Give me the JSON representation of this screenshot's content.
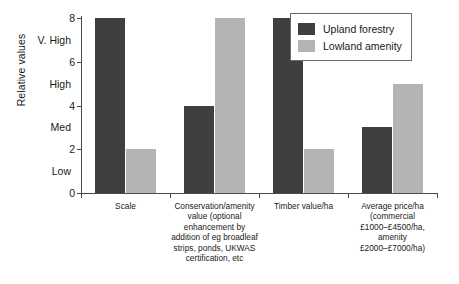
{
  "chart_data": {
    "type": "bar",
    "title": "",
    "xlabel": "",
    "ylabel": "Relative values",
    "ylim": [
      0,
      8
    ],
    "grid": false,
    "legend_position": "top-right",
    "categories": [
      "Scale",
      "Conservation/amenity value (optional enhancement by addition of eg broadleaf strips, ponds, UKWAS certification, etc",
      "Timber value/ha",
      "Average price/ha (commercial £1000–£4500/ha, amenity £2000–£7000/ha)"
    ],
    "category_lines": [
      [
        "Scale"
      ],
      [
        "Conservation/amenity",
        "value (optional",
        "enhancement by",
        "addition of eg broadleaf",
        "strips, ponds, UKWAS",
        "certification, etc"
      ],
      [
        "Timber value/ha"
      ],
      [
        "Average price/ha",
        "(commercial",
        "£1000–£4500/ha,",
        "amenity",
        "£2000–£7000/ha)"
      ]
    ],
    "series": [
      {
        "name": "Upland forestry",
        "color": "#3f3f3f",
        "values": [
          8,
          4,
          8,
          3
        ]
      },
      {
        "name": "Lowland amenity",
        "color": "#b4b4b4",
        "values": [
          2,
          8,
          2,
          5
        ]
      }
    ],
    "y_numeric_ticks": [
      {
        "value": 0,
        "label": "0"
      },
      {
        "value": 2,
        "label": "2"
      },
      {
        "value": 4,
        "label": "4"
      },
      {
        "value": 6,
        "label": "6"
      },
      {
        "value": 8,
        "label": "8"
      }
    ],
    "y_word_ticks": [
      {
        "value": 1,
        "label": "Low"
      },
      {
        "value": 3,
        "label": "Med"
      },
      {
        "value": 5,
        "label": "High"
      },
      {
        "value": 7,
        "label": "V. High"
      }
    ]
  },
  "legend": {
    "items": [
      {
        "label": "Upland forestry",
        "color": "#3f3f3f"
      },
      {
        "label": "Lowland amenity",
        "color": "#b4b4b4"
      }
    ]
  }
}
